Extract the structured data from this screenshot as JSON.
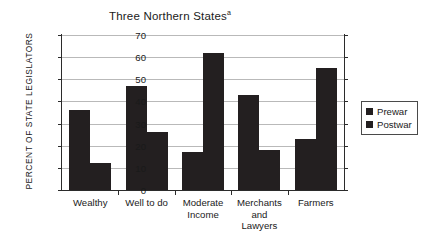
{
  "chart_data": {
    "type": "bar",
    "title": "Three Northern States",
    "title_superscript": "a",
    "xlabel": "",
    "ylabel": "PERCENT OF STATE LEGISLATORS",
    "ylim": [
      0,
      70
    ],
    "ytick_step": 10,
    "yticks": [
      70,
      60,
      50,
      40,
      30,
      20,
      10,
      0
    ],
    "ytick_labels": [
      "70",
      "60",
      "50",
      "40",
      "30",
      "20",
      "10",
      "0"
    ],
    "grid": true,
    "legend_position": "right",
    "bar_color": "#231f20",
    "grid_color": "#b9b9b9",
    "axis_color": "#2b2b2b",
    "categories": [
      "Wealthy",
      "Well to do",
      "Moderate\nIncome",
      "Merchants\nand\nLawyers",
      "Farmers"
    ],
    "category_labels": [
      [
        "Wealthy"
      ],
      [
        "Well to do"
      ],
      [
        "Moderate",
        "Income"
      ],
      [
        "Merchants",
        "and",
        "Lawyers"
      ],
      [
        "Farmers"
      ]
    ],
    "series": [
      {
        "name": "Prewar",
        "values": [
          36,
          47,
          17,
          43,
          23
        ]
      },
      {
        "name": "Postwar",
        "values": [
          12,
          26,
          62,
          18,
          55
        ]
      }
    ]
  },
  "legend": {
    "items": [
      {
        "label": "Prewar"
      },
      {
        "label": "Postwar"
      }
    ]
  }
}
